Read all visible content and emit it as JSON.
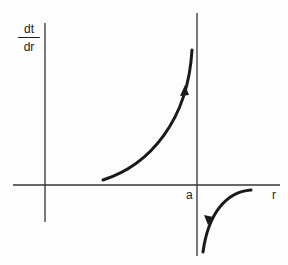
{
  "diagram": {
    "y_axis_label_numerator": "dt",
    "y_axis_label_denominator": "dr",
    "x_axis_label": "r",
    "asymptote_label": "a",
    "curves": [
      {
        "name": "left-branch",
        "direction": "up",
        "description": "increasing toward asymptote from left"
      },
      {
        "name": "right-branch",
        "direction": "down",
        "description": "decreasing toward asymptote from right"
      }
    ]
  }
}
